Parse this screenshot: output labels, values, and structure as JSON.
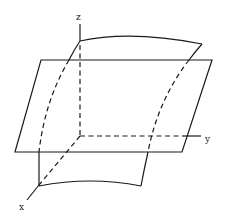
{
  "diagram": {
    "axes": {
      "x_label": "x",
      "y_label": "y",
      "z_label": "z"
    },
    "elements": [
      {
        "type": "plane",
        "description": "horizontal parallelogram plane"
      },
      {
        "type": "curved-surface",
        "description": "curved vertical surface intersecting the plane"
      },
      {
        "type": "axis",
        "name": "x"
      },
      {
        "type": "axis",
        "name": "y"
      },
      {
        "type": "axis",
        "name": "z"
      }
    ],
    "colors": {
      "line": "#1a1a1a",
      "background": "#ffffff"
    }
  }
}
